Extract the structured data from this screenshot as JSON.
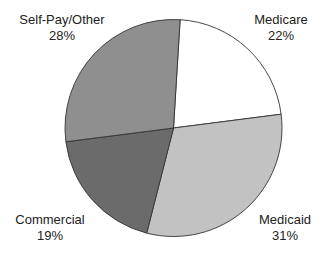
{
  "chart_data": {
    "type": "pie",
    "title": "",
    "start_angle_deg": 3.5,
    "direction": "clockwise",
    "center": [
      173.5,
      128
    ],
    "radius": 108.5,
    "slices": [
      {
        "label": "Medicare",
        "value": 22,
        "display": "22%",
        "color": "#ffffff"
      },
      {
        "label": "Medicaid",
        "value": 31,
        "display": "31%",
        "color": "#c2c2c2"
      },
      {
        "label": "Commercial",
        "value": 19,
        "display": "19%",
        "color": "#6b6b6b"
      },
      {
        "label": "Self-Pay/Other",
        "value": 28,
        "display": "28%",
        "color": "#8f8f8f"
      }
    ],
    "legend": "none",
    "labels_outside": true
  },
  "labels": {
    "medicare": {
      "name": "Medicare",
      "pct": "22%"
    },
    "medicaid": {
      "name": "Medicaid",
      "pct": "31%"
    },
    "commercial": {
      "name": "Commercial",
      "pct": "19%"
    },
    "selfpay": {
      "name": "Self-Pay/Other",
      "pct": "28%"
    }
  }
}
